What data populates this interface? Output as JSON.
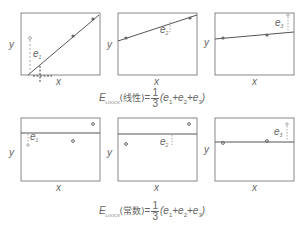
{
  "top_row": {
    "panels": [
      {
        "id": "linear-1",
        "x_label": "x",
        "y_label": "y",
        "error_label": "e",
        "error_sub": "1"
      },
      {
        "id": "linear-2",
        "x_label": "x",
        "y_label": "y",
        "error_label": "e",
        "error_sub": "2"
      },
      {
        "id": "linear-3",
        "x_label": "x",
        "y_label": "y",
        "error_label": "e",
        "error_sub": "3"
      }
    ],
    "equation": {
      "lhs": "E",
      "lhs_sub": "LOOCV",
      "model": "(线性)",
      "eq": "=",
      "frac_num": "1",
      "frac_den": "3",
      "rhs": "(e",
      "rhs_terms": [
        "1",
        "2",
        "3"
      ]
    }
  },
  "bottom_row": {
    "panels": [
      {
        "id": "const-1",
        "x_label": "x",
        "y_label": "y",
        "error_label": "e",
        "error_sub": "1"
      },
      {
        "id": "const-2",
        "x_label": "x",
        "y_label": "y",
        "error_label": "e",
        "error_sub": "2"
      },
      {
        "id": "const-3",
        "x_label": "x",
        "y_label": "y",
        "error_label": "e",
        "error_sub": "3"
      }
    ],
    "equation": {
      "lhs": "E",
      "lhs_sub": "LOOCV",
      "model": "(常数)",
      "eq": "=",
      "frac_num": "1",
      "frac_den": "3",
      "rhs": "(e",
      "rhs_terms": [
        "1",
        "2",
        "3"
      ]
    }
  },
  "colors": {
    "frame": "#777777",
    "line": "#555555",
    "dash": "#aaaaaa",
    "point": "#666666"
  }
}
